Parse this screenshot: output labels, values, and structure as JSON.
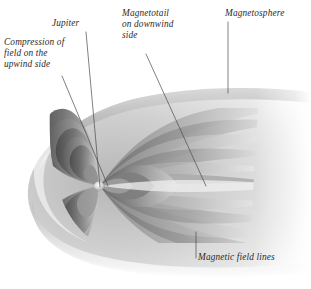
{
  "figure": {
    "style": "grayscale airbrush scientific illustration",
    "background_color": "#ffffff",
    "ink_color": "#2b2b2b",
    "palette": {
      "darkest": "#3c3c3c",
      "mid": "#8d8d8d",
      "light": "#c9c9c9",
      "lightest": "#efefef",
      "leader_line": "#4a4a4a"
    }
  },
  "labels": [
    {
      "id": "compression",
      "text": "Compression of\nfield on the\nupwind side",
      "leader": {
        "x1": 62,
        "y1": 76,
        "x2": 108,
        "y2": 186
      }
    },
    {
      "id": "jupiter",
      "text": "Jupiter",
      "leader": {
        "x1": 86,
        "y1": 32,
        "x2": 100,
        "y2": 187
      }
    },
    {
      "id": "magnetotail",
      "text": "Magnetotail\non downwind\nside",
      "leader": {
        "x1": 146,
        "y1": 54,
        "x2": 206,
        "y2": 186
      }
    },
    {
      "id": "magnetosphere",
      "text": "Magnetosphere",
      "leader": {
        "x1": 228,
        "y1": 22,
        "x2": 228,
        "y2": 93
      }
    },
    {
      "id": "fieldlines",
      "text": "Magnetic field lines",
      "leader": {
        "x1": 196,
        "y1": 232,
        "x2": 196,
        "y2": 258
      }
    }
  ],
  "diagram_parts": [
    {
      "name": "magnetopause-boundary",
      "description": "rounded bow-shaped outer shell, nose at left, flaring into tail at right"
    },
    {
      "name": "jupiter-planet",
      "description": "small bright dot at the dipole centre",
      "x": 99,
      "y": 186
    },
    {
      "name": "compressed-field-shells",
      "description": "nested dipole loops squashed on the left upwind side"
    },
    {
      "name": "magnetotail-shells",
      "description": "elongated stretched field lines trailing to the right"
    }
  ]
}
